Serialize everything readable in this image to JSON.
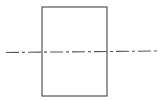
{
  "diagram": {
    "type": "technical-drawing",
    "canvas": {
      "width": 162,
      "height": 100,
      "background": "#ffffff"
    },
    "rectangle": {
      "x": 42,
      "y": 7,
      "width": 65,
      "height": 89,
      "stroke": "#555555",
      "stroke_width": 1.2
    },
    "center_line": {
      "x1": 6,
      "y1": 52.5,
      "x2": 157,
      "y2": 51,
      "stroke": "#555555",
      "stroke_width": 1.1,
      "dash_pattern": "13 3 3 3"
    }
  }
}
